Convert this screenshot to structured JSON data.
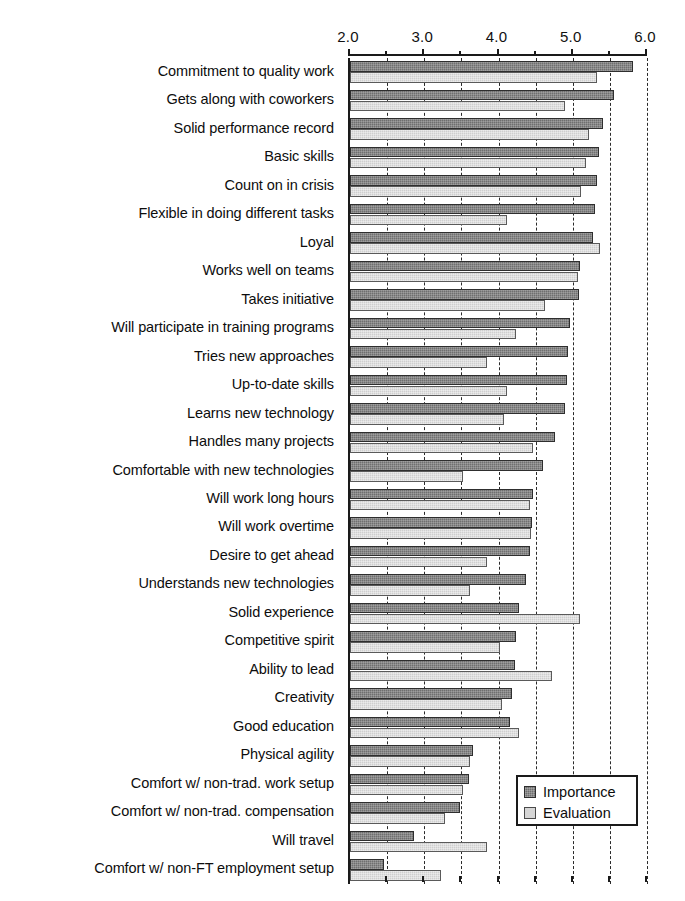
{
  "chart_data": {
    "type": "bar",
    "orientation": "horizontal",
    "title": "",
    "xlabel": "",
    "ylabel": "",
    "xlim": [
      2.0,
      6.0
    ],
    "grid": true,
    "legend_position": "bottom-right",
    "x_major_ticks": [
      "2.0",
      "3.0",
      "4.0",
      "5.0",
      "6.0"
    ],
    "x_major_values": [
      2.0,
      3.0,
      4.0,
      5.0,
      6.0
    ],
    "x_minor_values": [
      2.5,
      3.5,
      4.5,
      5.5
    ],
    "categories": [
      "Commitment to quality work",
      "Gets along with coworkers",
      "Solid performance record",
      "Basic skills",
      "Count on in crisis",
      "Flexible in doing different tasks",
      "Loyal",
      "Works well on teams",
      "Takes initiative",
      "Will participate in training programs",
      "Tries new approaches",
      "Up-to-date skills",
      "Learns new technology",
      "Handles many projects",
      "Comfortable with new technologies",
      "Will work long hours",
      "Will work overtime",
      "Desire to get ahead",
      "Understands new technologies",
      "Solid experience",
      "Competitive spirit",
      "Ability to lead",
      "Creativity",
      "Good education",
      "Physical agility",
      "Comfort w/ non-trad. work setup",
      "Comfort w/ non-trad. compensation",
      "Will travel",
      "Comfort w/ non-FT employment setup"
    ],
    "series": [
      {
        "name": "Importance",
        "color": "#6f6f6f",
        "values": [
          5.81,
          5.55,
          5.41,
          5.35,
          5.33,
          5.3,
          5.27,
          5.1,
          5.08,
          4.96,
          4.93,
          4.92,
          4.9,
          4.76,
          4.6,
          4.47,
          4.45,
          4.42,
          4.37,
          4.28,
          4.23,
          4.22,
          4.18,
          4.15,
          3.65,
          3.6,
          3.48,
          2.86,
          2.46
        ]
      },
      {
        "name": "Evaluation",
        "color": "#cfcfcf",
        "values": [
          5.33,
          4.9,
          5.22,
          5.18,
          5.11,
          4.11,
          5.37,
          5.07,
          4.63,
          4.23,
          3.85,
          4.12,
          4.08,
          4.47,
          3.52,
          4.42,
          4.44,
          3.84,
          3.62,
          5.1,
          4.02,
          4.72,
          4.05,
          4.27,
          3.62,
          3.52,
          3.28,
          3.85,
          3.22
        ]
      }
    ]
  },
  "legend": {
    "items": [
      {
        "label": "Importance"
      },
      {
        "label": "Evaluation"
      }
    ]
  }
}
